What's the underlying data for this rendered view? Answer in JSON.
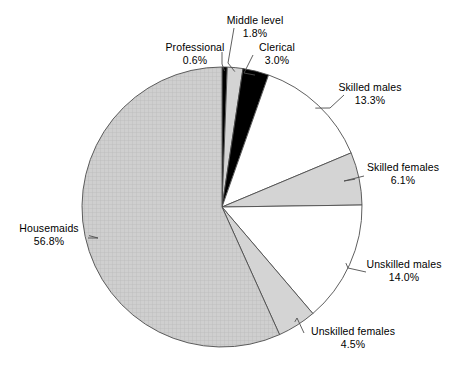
{
  "chart_data": {
    "type": "pie",
    "title": "",
    "subtitle": "",
    "xlabel": "",
    "ylabel": "",
    "legend_position": "none",
    "grid": false,
    "units": "percent",
    "start_angle_deg": 0,
    "direction": "clockwise",
    "categories": [
      "Professional",
      "Middle level",
      "Clerical",
      "Skilled males",
      "Skilled females",
      "Unskilled males",
      "Unskilled females",
      "Housemaids"
    ],
    "values": [
      0.6,
      1.8,
      3.0,
      13.3,
      6.1,
      14.0,
      4.5,
      56.8
    ],
    "slices": [
      {
        "label": "Professional",
        "value": 0.6,
        "value_text": "0.6%",
        "fill": "#000000",
        "pattern": "solid-black"
      },
      {
        "label": "Middle level",
        "value": 1.8,
        "value_text": "1.8%",
        "fill": "#d4d4d4",
        "pattern": "light-gray"
      },
      {
        "label": "Clerical",
        "value": 3.0,
        "value_text": "3.0%",
        "fill": "#000000",
        "pattern": "solid-black"
      },
      {
        "label": "Skilled males",
        "value": 13.3,
        "value_text": "13.3%",
        "fill": "#ffffff",
        "pattern": "white"
      },
      {
        "label": "Skilled females",
        "value": 6.1,
        "value_text": "6.1%",
        "fill": "#d4d4d4",
        "pattern": "light-gray"
      },
      {
        "label": "Unskilled males",
        "value": 14.0,
        "value_text": "14.0%",
        "fill": "#ffffff",
        "pattern": "white"
      },
      {
        "label": "Unskilled females",
        "value": 4.5,
        "value_text": "4.5%",
        "fill": "#d4d4d4",
        "pattern": "light-gray"
      },
      {
        "label": "Housemaids",
        "value": 56.8,
        "value_text": "56.8%",
        "fill": "#c9c9c9",
        "pattern": "crosshatch-grid"
      }
    ],
    "colors": {
      "outline": "#4d4d4d",
      "leader_line": "#4d4d4d",
      "background": "#ffffff",
      "text": "#000000"
    }
  }
}
